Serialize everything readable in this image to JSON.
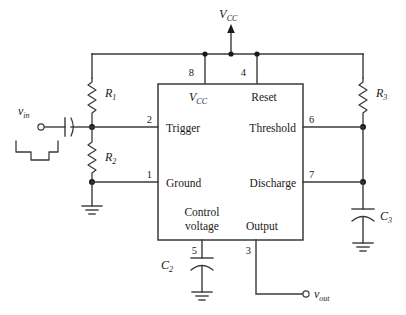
{
  "diagram": {
    "type": "circuit-schematic",
    "supply": {
      "label_v": "V",
      "label_sub": "CC"
    },
    "ic": {
      "pins": [
        {
          "number": "8",
          "label": "V",
          "label_sub": "CC",
          "side": "top",
          "name": "vcc"
        },
        {
          "number": "4",
          "label": "Reset",
          "side": "top",
          "name": "reset"
        },
        {
          "number": "2",
          "label": "Trigger",
          "side": "left",
          "name": "trigger"
        },
        {
          "number": "1",
          "label": "Ground",
          "side": "left",
          "name": "ground"
        },
        {
          "number": "6",
          "label": "Threshold",
          "side": "right",
          "name": "threshold"
        },
        {
          "number": "7",
          "label": "Discharge",
          "side": "right",
          "name": "discharge"
        },
        {
          "number": "5",
          "label_line1": "Control",
          "label_line2": "voltage",
          "side": "bottom",
          "name": "control-voltage"
        },
        {
          "number": "3",
          "label": "Output",
          "side": "bottom",
          "name": "output"
        }
      ]
    },
    "components": [
      {
        "id": "R1",
        "letter": "R",
        "sub": "1",
        "kind": "resistor"
      },
      {
        "id": "R2",
        "letter": "R",
        "sub": "2",
        "kind": "resistor"
      },
      {
        "id": "R3",
        "letter": "R",
        "sub": "3",
        "kind": "resistor"
      },
      {
        "id": "C2",
        "letter": "C",
        "sub": "2",
        "kind": "capacitor"
      },
      {
        "id": "C3",
        "letter": "C",
        "sub": "3",
        "kind": "capacitor"
      },
      {
        "id": "Cin",
        "letter": "",
        "sub": "",
        "kind": "coupling-capacitor"
      }
    ],
    "terminals": [
      {
        "id": "vin",
        "letter": "v",
        "sub": "in",
        "kind": "input",
        "waveform": "negative-going-pulse"
      },
      {
        "id": "vout",
        "letter": "v",
        "sub": "out",
        "kind": "output"
      }
    ],
    "grounds": 4
  }
}
